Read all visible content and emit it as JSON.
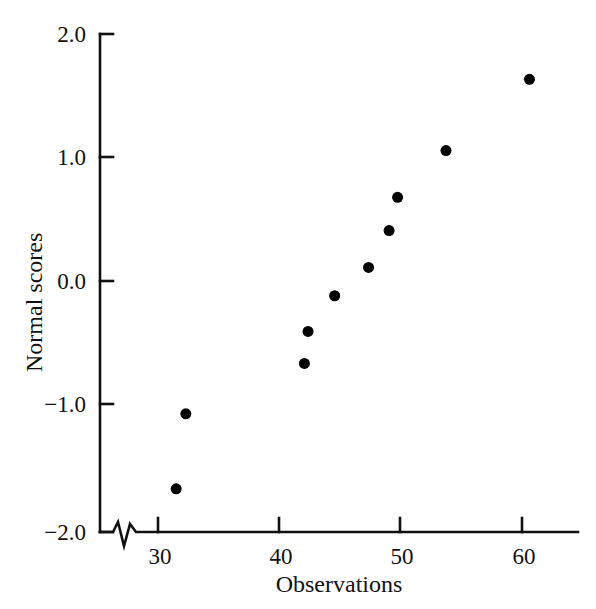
{
  "chart_data": {
    "type": "scatter",
    "title": "",
    "subtitle": "",
    "xlabel": "Observations",
    "ylabel": "Normal scores",
    "xlim": [
      26.5,
      64.7
    ],
    "ylim": [
      -2.0,
      2.0
    ],
    "xticks": [
      30,
      40,
      50,
      60
    ],
    "xtick_labels": [
      "30",
      "40",
      "50",
      "60"
    ],
    "yticks": [
      -2.0,
      -1.0,
      0.0,
      1.0,
      2.0
    ],
    "ytick_labels": [
      "−2.0",
      "−1.0",
      "0.0",
      "1.0",
      "2.0"
    ],
    "grid": false,
    "legend": null,
    "axis_break": {
      "axis": "x",
      "position": 28.0,
      "style": "zigzag"
    },
    "marker": {
      "shape": "circle",
      "filled": true,
      "color": "#000000",
      "size_px": 11
    },
    "x": [
      31.5,
      32.3,
      42.1,
      42.4,
      44.6,
      47.4,
      49.1,
      49.8,
      53.8,
      60.7
    ],
    "y": [
      -1.69,
      -1.08,
      -0.67,
      -0.41,
      -0.12,
      0.11,
      0.41,
      0.68,
      1.06,
      1.64
    ],
    "points": [
      {
        "x": 31.5,
        "y": -1.69
      },
      {
        "x": 32.3,
        "y": -1.08
      },
      {
        "x": 42.1,
        "y": -0.67
      },
      {
        "x": 42.4,
        "y": -0.41
      },
      {
        "x": 44.6,
        "y": -0.12
      },
      {
        "x": 47.4,
        "y": 0.11
      },
      {
        "x": 49.1,
        "y": 0.41
      },
      {
        "x": 49.8,
        "y": 0.68
      },
      {
        "x": 53.8,
        "y": 1.06
      },
      {
        "x": 60.7,
        "y": 1.64
      }
    ]
  },
  "colors": {
    "background": "#ffffff",
    "axis": "#111111",
    "marker": "#000000",
    "text": "#111111"
  }
}
